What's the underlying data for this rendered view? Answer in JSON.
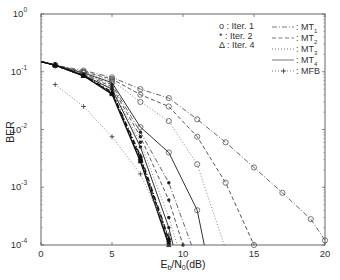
{
  "chart_data": {
    "type": "line",
    "title": "",
    "xlabel": "Eb/N0(dB)",
    "xlabel_parts": {
      "main1": "E",
      "sub1": "b",
      "mid": "/N",
      "sub2": "0",
      "tail": "(dB)"
    },
    "ylabel": "BER",
    "xlim": [
      0,
      20
    ],
    "ylim": [
      0.0001,
      1
    ],
    "yscale": "log",
    "grid": false,
    "x_ticks": [
      0,
      5,
      10,
      15,
      20
    ],
    "x_tick_labels": [
      "0",
      "5",
      "10",
      "15",
      "20"
    ],
    "y_ticks": [
      1,
      0.1,
      0.01,
      0.001,
      0.0001
    ],
    "y_tick_labels": [
      {
        "base": "10",
        "exp": "0"
      },
      {
        "base": "10",
        "exp": "-1"
      },
      {
        "base": "10",
        "exp": "-2"
      },
      {
        "base": "10",
        "exp": "-3"
      },
      {
        "base": "10",
        "exp": "-4"
      }
    ],
    "legend_markers": {
      "position": "upper-right-inner-left",
      "entries": [
        {
          "symbol": "o",
          "label": "o : Iter. 1"
        },
        {
          "symbol": "*",
          "label": "* : Iter. 2"
        },
        {
          "symbol": "Δ",
          "label": "Δ : Iter. 4"
        }
      ]
    },
    "legend_lines": {
      "position": "upper-right",
      "entries": [
        {
          "style": "dashdot",
          "label": ": MT",
          "sub": "1"
        },
        {
          "style": "dashed",
          "label": ": MT",
          "sub": "2"
        },
        {
          "style": "dotted",
          "label": ": MT",
          "sub": "3"
        },
        {
          "style": "solid",
          "label": ": MT",
          "sub": "4"
        },
        {
          "style": "dotted-plus",
          "label": ": MFB",
          "sub": ""
        }
      ]
    },
    "series": [
      {
        "name": "MT1 Iter.1",
        "style": "dashdot",
        "marker": "o",
        "x": [
          0,
          1,
          3,
          5,
          7,
          9,
          11,
          13,
          15,
          17,
          19,
          20
        ],
        "y": [
          0.15,
          0.13,
          0.105,
          0.08,
          0.05,
          0.035,
          0.015,
          0.006,
          0.0022,
          0.0008,
          0.00028,
          0.00012
        ]
      },
      {
        "name": "MT2 Iter.1",
        "style": "dashed",
        "marker": "o",
        "x": [
          0,
          1,
          3,
          5,
          7,
          9,
          11,
          13,
          15
        ],
        "y": [
          0.15,
          0.13,
          0.1,
          0.075,
          0.04,
          0.025,
          0.0075,
          0.0012,
          0.0001
        ]
      },
      {
        "name": "MT3 Iter.1",
        "style": "dotted",
        "marker": "o",
        "x": [
          0,
          1,
          3,
          5,
          7,
          9,
          11,
          12.9
        ],
        "y": [
          0.15,
          0.13,
          0.098,
          0.07,
          0.03,
          0.014,
          0.0025,
          0.0001
        ]
      },
      {
        "name": "MT4 Iter.1",
        "style": "solid",
        "marker": "o",
        "x": [
          0,
          1,
          3,
          5,
          7,
          9,
          11,
          11.5
        ],
        "y": [
          0.15,
          0.13,
          0.095,
          0.065,
          0.011,
          0.004,
          0.0004,
          0.0001
        ]
      },
      {
        "name": "MT1 Iter.2",
        "style": "dashdot",
        "marker": "*",
        "x": [
          0,
          1,
          3,
          5,
          7,
          9,
          10.6
        ],
        "y": [
          0.15,
          0.13,
          0.092,
          0.06,
          0.009,
          0.0012,
          0.0001
        ]
      },
      {
        "name": "MT2 Iter.2",
        "style": "dashed",
        "marker": "*",
        "x": [
          0,
          1,
          3,
          5,
          7,
          9,
          10.0
        ],
        "y": [
          0.15,
          0.13,
          0.09,
          0.055,
          0.0075,
          0.0006,
          0.0001
        ]
      },
      {
        "name": "MT3 Iter.2",
        "style": "dotted",
        "marker": "*",
        "x": [
          0,
          1,
          3,
          5,
          7,
          9,
          9.6
        ],
        "y": [
          0.15,
          0.13,
          0.088,
          0.052,
          0.006,
          0.0003,
          0.0001
        ]
      },
      {
        "name": "MT4 Iter.2",
        "style": "solid",
        "marker": "*",
        "x": [
          0,
          1,
          3,
          5,
          7,
          9,
          9.3
        ],
        "y": [
          0.15,
          0.13,
          0.087,
          0.05,
          0.005,
          0.0002,
          0.0001
        ]
      },
      {
        "name": "MT1 Iter.4",
        "style": "dashdot",
        "marker": "Δ",
        "x": [
          0,
          1,
          3,
          5,
          7,
          9
        ],
        "y": [
          0.15,
          0.13,
          0.086,
          0.045,
          0.0035,
          0.00013
        ]
      },
      {
        "name": "MT2 Iter.4",
        "style": "dashed",
        "marker": "Δ",
        "x": [
          0,
          1,
          3,
          5,
          7,
          9
        ],
        "y": [
          0.15,
          0.13,
          0.085,
          0.043,
          0.0032,
          0.00012
        ]
      },
      {
        "name": "MT3 Iter.4",
        "style": "dotted",
        "marker": "Δ",
        "x": [
          0,
          1,
          3,
          5,
          7,
          9
        ],
        "y": [
          0.15,
          0.13,
          0.085,
          0.042,
          0.003,
          0.00011
        ]
      },
      {
        "name": "MT4 Iter.4",
        "style": "solid",
        "marker": "Δ",
        "x": [
          0,
          1,
          3,
          5,
          7,
          9
        ],
        "y": [
          0.15,
          0.13,
          0.085,
          0.041,
          0.0028,
          0.0001
        ]
      },
      {
        "name": "MFB",
        "style": "dotted",
        "marker": "+",
        "x": [
          1,
          3,
          5,
          7,
          9
        ],
        "y": [
          0.06,
          0.025,
          0.0075,
          0.0017,
          0.00015
        ]
      }
    ]
  }
}
